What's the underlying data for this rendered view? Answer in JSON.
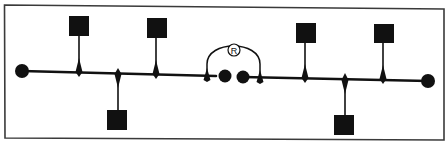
{
  "diagram": {
    "type": "network-bus-topology",
    "colors": {
      "ink": "#111111",
      "frame": "#3a3a3a",
      "background": "#ffffff"
    },
    "repeater": {
      "label": "R"
    },
    "segments": [
      {
        "name": "segment-left",
        "terminator": "left",
        "stations": [
          {
            "side": "top"
          },
          {
            "side": "bottom"
          },
          {
            "side": "top"
          }
        ]
      },
      {
        "name": "segment-right",
        "terminator": "right",
        "stations": [
          {
            "side": "top"
          },
          {
            "side": "bottom"
          },
          {
            "side": "top"
          }
        ]
      }
    ]
  }
}
